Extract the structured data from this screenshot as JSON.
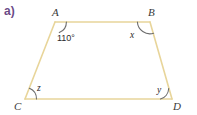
{
  "figure": {
    "part_label": "a)",
    "shape_name": "trapezoid-ABCD",
    "colors": {
      "edge": "#e8d59a",
      "arc": "#6d6d6d",
      "label_text": "#3a3a3a",
      "part_label": "#6b4a86",
      "background": "#ffffff"
    },
    "vertices": [
      {
        "name": "A",
        "label": "A",
        "x": 55,
        "y": 22
      },
      {
        "name": "B",
        "label": "B",
        "x": 150,
        "y": 22
      },
      {
        "name": "C",
        "label": "C",
        "x": 25,
        "y": 99
      },
      {
        "name": "D",
        "label": "D",
        "x": 172,
        "y": 99
      }
    ],
    "edges": [
      {
        "name": "edge-AB",
        "from": "A",
        "to": "B"
      },
      {
        "name": "edge-BD",
        "from": "B",
        "to": "D"
      },
      {
        "name": "edge-DC",
        "from": "D",
        "to": "C"
      },
      {
        "name": "edge-CA",
        "from": "C",
        "to": "A"
      }
    ],
    "angles": [
      {
        "name": "angle-at-A",
        "vertex": "A",
        "label": "110°",
        "known": true
      },
      {
        "name": "angle-at-B",
        "vertex": "B",
        "label": "x",
        "known": false
      },
      {
        "name": "angle-at-C",
        "vertex": "C",
        "label": "z",
        "known": false
      },
      {
        "name": "angle-at-D",
        "vertex": "D",
        "label": "y",
        "known": false
      }
    ]
  }
}
